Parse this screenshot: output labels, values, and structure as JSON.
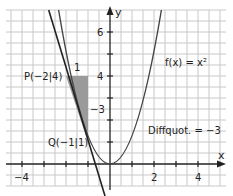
{
  "diagram": {
    "function_label": "f(x) = x²",
    "point_p": "P(−2|4)",
    "point_q": "Q(−1|1)",
    "diff_quotient": "Diffquot. = −3",
    "delta_x_label": "1",
    "delta_y_label": "−3",
    "axis_x": "x",
    "axis_y": "y",
    "x_ticks": [
      "−4",
      "2",
      "4"
    ],
    "y_ticks": [
      "6",
      "4"
    ],
    "colors": {
      "grid": "#c8c8c8",
      "axis": "#222222",
      "curve": "#444444",
      "secant": "#222222",
      "triangle": "#9a9a9a"
    }
  }
}
